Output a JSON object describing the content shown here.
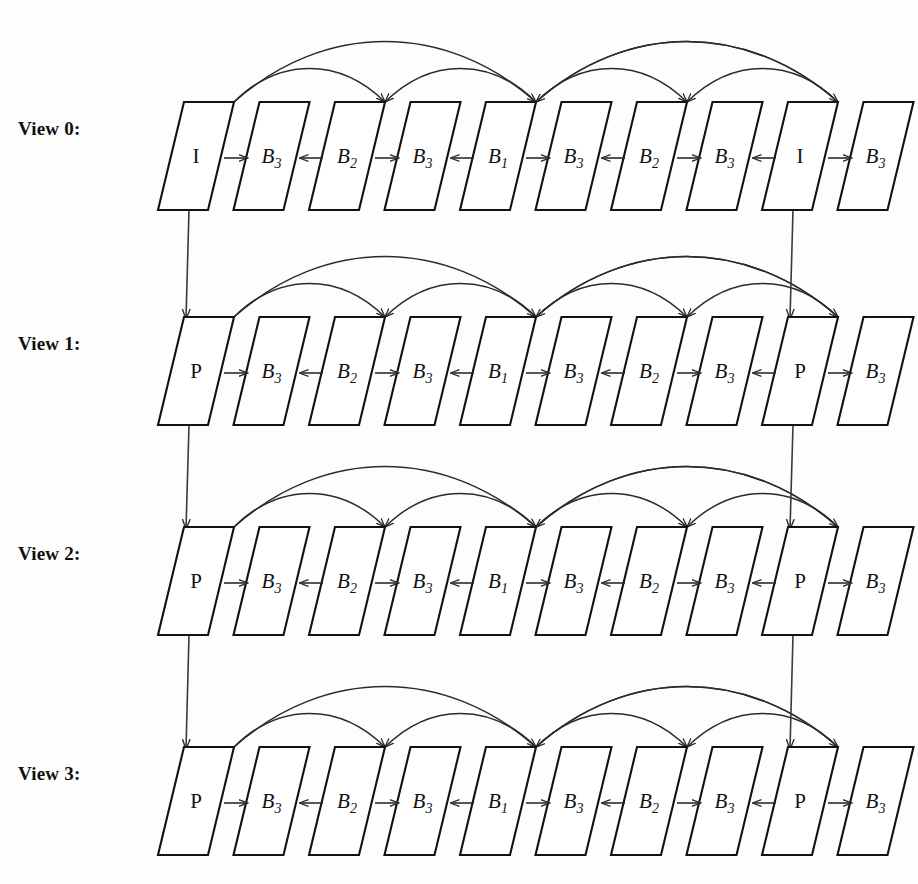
{
  "diagram": {
    "type": "prediction-structure",
    "row_label_suffix": ":",
    "frames_per_view": 10,
    "views": [
      {
        "label": "View 0:",
        "id": "view-0",
        "frames": [
          {
            "base": "I",
            "sub": ""
          },
          {
            "base": "B",
            "sub": "3"
          },
          {
            "base": "B",
            "sub": "2"
          },
          {
            "base": "B",
            "sub": "3"
          },
          {
            "base": "B",
            "sub": "1"
          },
          {
            "base": "B",
            "sub": "3"
          },
          {
            "base": "B",
            "sub": "2"
          },
          {
            "base": "B",
            "sub": "3"
          },
          {
            "base": "I",
            "sub": ""
          },
          {
            "base": "B",
            "sub": "3"
          }
        ]
      },
      {
        "label": "View 1:",
        "id": "view-1",
        "frames": [
          {
            "base": "P",
            "sub": ""
          },
          {
            "base": "B",
            "sub": "3"
          },
          {
            "base": "B",
            "sub": "2"
          },
          {
            "base": "B",
            "sub": "3"
          },
          {
            "base": "B",
            "sub": "1"
          },
          {
            "base": "B",
            "sub": "3"
          },
          {
            "base": "B",
            "sub": "2"
          },
          {
            "base": "B",
            "sub": "3"
          },
          {
            "base": "P",
            "sub": ""
          },
          {
            "base": "B",
            "sub": "3"
          }
        ]
      },
      {
        "label": "View 2:",
        "id": "view-2",
        "frames": [
          {
            "base": "P",
            "sub": ""
          },
          {
            "base": "B",
            "sub": "3"
          },
          {
            "base": "B",
            "sub": "2"
          },
          {
            "base": "B",
            "sub": "3"
          },
          {
            "base": "B",
            "sub": "1"
          },
          {
            "base": "B",
            "sub": "3"
          },
          {
            "base": "B",
            "sub": "2"
          },
          {
            "base": "B",
            "sub": "3"
          },
          {
            "base": "P",
            "sub": ""
          },
          {
            "base": "B",
            "sub": "3"
          }
        ]
      },
      {
        "label": "View 3:",
        "id": "view-3",
        "frames": [
          {
            "base": "P",
            "sub": ""
          },
          {
            "base": "B",
            "sub": "3"
          },
          {
            "base": "B",
            "sub": "2"
          },
          {
            "base": "B",
            "sub": "3"
          },
          {
            "base": "B",
            "sub": "1"
          },
          {
            "base": "B",
            "sub": "3"
          },
          {
            "base": "B",
            "sub": "2"
          },
          {
            "base": "B",
            "sub": "3"
          },
          {
            "base": "P",
            "sub": ""
          },
          {
            "base": "B",
            "sub": "3"
          }
        ]
      }
    ],
    "horizontal_arrows": [
      {
        "from": 0,
        "to": 1,
        "direction": "right"
      },
      {
        "from": 2,
        "to": 1,
        "direction": "left"
      },
      {
        "from": 2,
        "to": 3,
        "direction": "right"
      },
      {
        "from": 4,
        "to": 3,
        "direction": "left"
      },
      {
        "from": 4,
        "to": 5,
        "direction": "right"
      },
      {
        "from": 6,
        "to": 5,
        "direction": "left"
      },
      {
        "from": 6,
        "to": 7,
        "direction": "right"
      },
      {
        "from": 8,
        "to": 7,
        "direction": "left"
      },
      {
        "from": 8,
        "to": 9,
        "direction": "right"
      }
    ],
    "reference_arcs": [
      {
        "from": 0,
        "to": 4,
        "level": "high"
      },
      {
        "from": 0,
        "to": 2,
        "level": "low"
      },
      {
        "from": 4,
        "to": 2,
        "level": "low"
      },
      {
        "from": 4,
        "to": 8,
        "level": "high"
      },
      {
        "from": 8,
        "to": 4,
        "level": "high"
      },
      {
        "from": 4,
        "to": 6,
        "level": "low"
      },
      {
        "from": 8,
        "to": 6,
        "level": "low"
      }
    ],
    "inter_view_arrows": [
      {
        "from_view": 0,
        "to_view": 1,
        "frame": 0
      },
      {
        "from_view": 1,
        "to_view": 2,
        "frame": 0
      },
      {
        "from_view": 2,
        "to_view": 3,
        "frame": 0
      },
      {
        "from_view": 0,
        "to_view": 1,
        "frame": 8
      },
      {
        "from_view": 1,
        "to_view": 2,
        "frame": 8
      },
      {
        "from_view": 2,
        "to_view": 3,
        "frame": 8
      }
    ],
    "colors": {
      "background": "#fdfdfc",
      "frame_stroke": "#121212",
      "frame_fill": "#ffffff",
      "arrow": "#2b2b2b",
      "text": "#111111"
    }
  }
}
